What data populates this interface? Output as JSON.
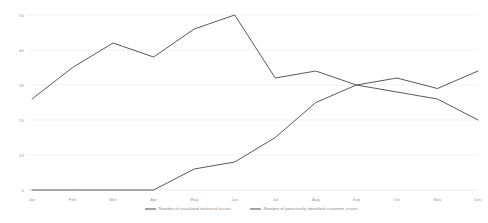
{
  "chart_data": {
    "type": "line",
    "title": "",
    "subtitle": "",
    "xlabel": "",
    "ylabel": "",
    "categories": [
      "Jan",
      "Feb",
      "Mar",
      "Apr",
      "May",
      "Jun",
      "Jul",
      "Aug",
      "Sep",
      "Oct",
      "Nov",
      "Dec"
    ],
    "ylim": [
      0,
      50
    ],
    "yticks": [
      0,
      10,
      20,
      30,
      40,
      50
    ],
    "ytick_labels": [
      "0",
      "10",
      "20",
      "30",
      "40",
      "50"
    ],
    "grid": true,
    "legend_position": "bottom",
    "series": [
      {
        "name": "Number of escalated technical issues",
        "color": "#595959",
        "values": [
          26,
          35,
          42,
          38,
          46,
          50,
          32,
          34,
          30,
          28,
          26,
          20
        ]
      },
      {
        "name": "Number of proactively identified customer issues",
        "color": "#595959",
        "values": [
          0,
          0,
          0,
          0,
          6,
          8,
          15,
          25,
          30,
          32,
          29,
          34
        ]
      }
    ]
  }
}
